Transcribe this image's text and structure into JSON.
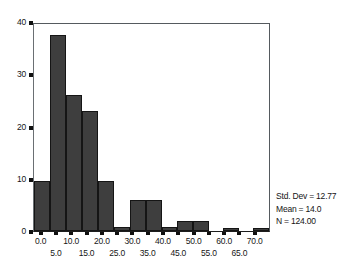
{
  "chart_data": {
    "type": "bar",
    "title": "",
    "xlabel": "",
    "ylabel": "",
    "ylim": [
      0,
      40
    ],
    "xlim": [
      -2.5,
      75
    ],
    "grid": false,
    "legend": null,
    "bin_width": 5,
    "categories": [
      "0.0",
      "5.0",
      "10.0",
      "15.0",
      "20.0",
      "25.0",
      "30.0",
      "35.0",
      "40.0",
      "45.0",
      "50.0",
      "55.0",
      "60.0",
      "65.0",
      "70.0"
    ],
    "values": [
      9.5,
      37.5,
      26,
      23,
      9.5,
      0.7,
      6,
      6,
      0.7,
      2,
      2,
      0,
      0.5,
      0,
      0.5
    ],
    "y_ticks": [
      {
        "value": 0,
        "label": "0"
      },
      {
        "value": 10,
        "label": "10"
      },
      {
        "value": 20,
        "label": "20"
      },
      {
        "value": 30,
        "label": "30"
      },
      {
        "value": 40,
        "label": "40"
      }
    ],
    "x_ticks": [
      {
        "value": 0.0,
        "label": "0.0",
        "row": "upper"
      },
      {
        "value": 5.0,
        "label": "5.0",
        "row": "lower"
      },
      {
        "value": 10.0,
        "label": "10.0",
        "row": "upper"
      },
      {
        "value": 15.0,
        "label": "15.0",
        "row": "lower"
      },
      {
        "value": 20.0,
        "label": "20.0",
        "row": "upper"
      },
      {
        "value": 25.0,
        "label": "25.0",
        "row": "lower"
      },
      {
        "value": 30.0,
        "label": "30.0",
        "row": "upper"
      },
      {
        "value": 35.0,
        "label": "35.0",
        "row": "lower"
      },
      {
        "value": 40.0,
        "label": "40.0",
        "row": "upper"
      },
      {
        "value": 45.0,
        "label": "45.0",
        "row": "lower"
      },
      {
        "value": 50.0,
        "label": "50.0",
        "row": "upper"
      },
      {
        "value": 55.0,
        "label": "55.0",
        "row": "lower"
      },
      {
        "value": 60.0,
        "label": "60.0",
        "row": "upper"
      },
      {
        "value": 65.0,
        "label": "65.0",
        "row": "lower"
      },
      {
        "value": 70.0,
        "label": "70.0",
        "row": "upper"
      }
    ],
    "annotations": {
      "std_dev": "Std. Dev = 12.77",
      "mean": "Mean = 14.0",
      "n": "N = 124.00"
    },
    "colors": {
      "bar_fill": "#3e3e3e",
      "bar_edge": "#151515",
      "axis": "#101010",
      "background": "#ffffff",
      "text": "#161616"
    }
  }
}
